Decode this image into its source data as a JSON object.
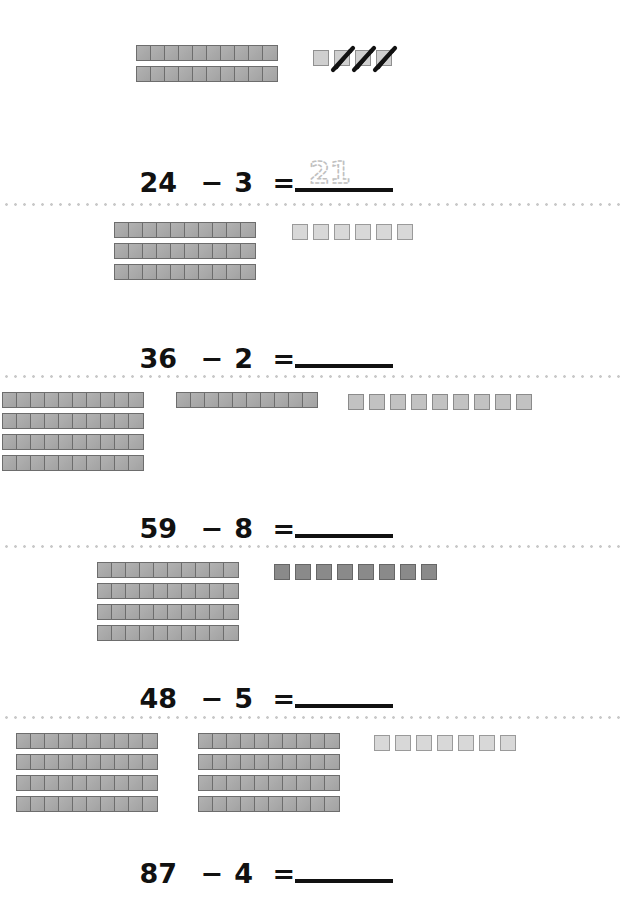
{
  "worksheet": {
    "type": "base-ten-blocks-subtraction",
    "background_color": "#ffffff",
    "rod_color": "#a8a8a8",
    "rod_border_color": "#6d6d6d",
    "separator_color": "#c9c9c9",
    "text_color": "#111111",
    "traced_answer_color": "#c0c0c0"
  },
  "symbols": {
    "minus": "−",
    "equals": "="
  },
  "problems": [
    {
      "id": "problem-1",
      "minuend": "24",
      "subtrahend": "3",
      "equals": "=",
      "minus": "−",
      "answer": "21",
      "answer_filled": true,
      "answer_style": "traced",
      "blocks": {
        "rod_count": 2,
        "rod_length": 10,
        "rod_columns": [
          2
        ],
        "unit_count": 4,
        "units_crossed_out": 3,
        "unit_shade": "shade-base"
      }
    },
    {
      "id": "problem-2",
      "minuend": "36",
      "subtrahend": "2",
      "equals": "=",
      "minus": "−",
      "answer": "",
      "answer_filled": false,
      "answer_style": "blank",
      "blocks": {
        "rod_count": 3,
        "rod_length": 10,
        "rod_columns": [
          3
        ],
        "unit_count": 6,
        "units_crossed_out": 0,
        "unit_shade": "shade-light"
      }
    },
    {
      "id": "problem-3",
      "minuend": "59",
      "subtrahend": "8",
      "equals": "=",
      "minus": "−",
      "answer": "",
      "answer_filled": false,
      "answer_style": "blank",
      "blocks": {
        "rod_count": 5,
        "rod_length": 10,
        "rod_columns": [
          4,
          1
        ],
        "unit_count": 9,
        "units_crossed_out": 0,
        "unit_shade": "shade-mid"
      }
    },
    {
      "id": "problem-4",
      "minuend": "48",
      "subtrahend": "5",
      "equals": "=",
      "minus": "−",
      "answer": "",
      "answer_filled": false,
      "answer_style": "blank",
      "blocks": {
        "rod_count": 4,
        "rod_length": 10,
        "rod_columns": [
          4
        ],
        "unit_count": 8,
        "units_crossed_out": 0,
        "unit_shade": "shade-dark"
      }
    },
    {
      "id": "problem-5",
      "minuend": "87",
      "subtrahend": "4",
      "equals": "=",
      "minus": "−",
      "answer": "",
      "answer_filled": false,
      "answer_style": "blank",
      "blocks": {
        "rod_count": 8,
        "rod_length": 10,
        "rod_columns": [
          4,
          4
        ],
        "unit_count": 7,
        "units_crossed_out": 0,
        "unit_shade": "shade-light"
      }
    }
  ]
}
